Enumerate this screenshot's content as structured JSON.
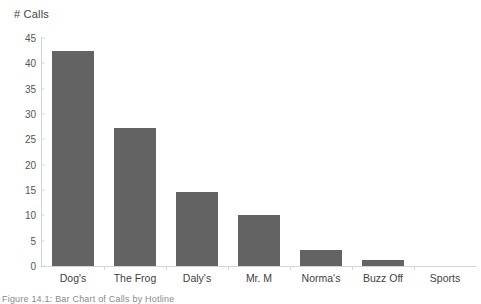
{
  "chart_data": {
    "type": "bar",
    "title": "",
    "subtitle": "",
    "xlabel": "",
    "ylabel": "# Calls",
    "categories": [
      "Dog's",
      "The Frog",
      "Daly's",
      "Mr. M",
      "Norma's",
      "Buzz Off",
      "Sports"
    ],
    "values": [
      42.5,
      27.3,
      14.7,
      10.1,
      3.1,
      1.2,
      0
    ],
    "ylim": [
      0,
      45
    ],
    "ytick_step": 5,
    "ytick_labels": [
      "0",
      "5",
      "10",
      "15",
      "20",
      "25",
      "30",
      "35",
      "40",
      "45"
    ],
    "grid": false,
    "legend": false,
    "legend_position": "none",
    "bar_color": "#636363",
    "axis_color": "#d4d4d4",
    "text_color": "#3f3f3f"
  },
  "caption": {
    "text": "Figure 14.1: Bar Chart of Calls by Hotline"
  }
}
